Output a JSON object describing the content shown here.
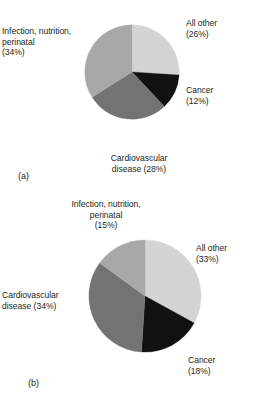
{
  "figure": {
    "background": "#ffffff",
    "text_color": "#231f20"
  },
  "palette": {
    "all_other": "#d4d4d4",
    "cancer": "#111111",
    "cardiovascular": "#737373",
    "infection": "#a8a8a8",
    "outline": "#8c8c8c"
  },
  "panels": [
    {
      "tag": "(a)",
      "slices": [
        {
          "label": "All other",
          "pct_label": "(26%)",
          "value": 26,
          "color_key": "all_other"
        },
        {
          "label": "Cancer",
          "pct_label": "(12%)",
          "value": 12,
          "color_key": "cancer"
        },
        {
          "label": "Cardiovascular disease",
          "pct_label": "(28%)",
          "value": 28,
          "color_key": "cardiovascular"
        },
        {
          "label": "Infection, nutrition, perinatal",
          "pct_label": "(34%)",
          "value": 34,
          "color_key": "infection"
        }
      ],
      "label_text": {
        "infection": "Infection, nutrition,\nperinatal\n(34%)",
        "all_other": "All other\n(26%)",
        "cancer": "Cancer\n(12%)",
        "cardiovascular": "Cardiovascular\ndisease (28%)"
      }
    },
    {
      "tag": "(b)",
      "slices": [
        {
          "label": "All other",
          "pct_label": "(33%)",
          "value": 33,
          "color_key": "all_other"
        },
        {
          "label": "Cancer",
          "pct_label": "(18%)",
          "value": 18,
          "color_key": "cancer"
        },
        {
          "label": "Cardiovascular disease",
          "pct_label": "(34%)",
          "value": 34,
          "color_key": "cardiovascular"
        },
        {
          "label": "Infection, nutrition, perinatal",
          "pct_label": "(15%)",
          "value": 15,
          "color_key": "infection"
        }
      ],
      "label_text": {
        "infection": "Infection, nutrition,\nperinatal\n(15%)",
        "all_other": "All other\n(33%)",
        "cancer": "Cancer\n(18%)",
        "cardiovascular": "Cardiovascular\ndisease (34%)"
      }
    }
  ],
  "chart_data": [
    {
      "type": "pie",
      "title": "(a)",
      "categories": [
        "All other",
        "Cancer",
        "Cardiovascular disease",
        "Infection, nutrition, perinatal"
      ],
      "values": [
        26,
        12,
        28,
        34
      ],
      "units": "percent",
      "start_angle_deg": 0,
      "direction": "clockwise",
      "colors": [
        "#d4d4d4",
        "#111111",
        "#737373",
        "#a8a8a8"
      ],
      "legend": "none",
      "labels_inline": true,
      "xlabel": "",
      "ylabel": ""
    },
    {
      "type": "pie",
      "title": "(b)",
      "categories": [
        "All other",
        "Cancer",
        "Cardiovascular disease",
        "Infection, nutrition, perinatal"
      ],
      "values": [
        33,
        18,
        34,
        15
      ],
      "units": "percent",
      "start_angle_deg": 0,
      "direction": "clockwise",
      "colors": [
        "#d4d4d4",
        "#111111",
        "#737373",
        "#a8a8a8"
      ],
      "legend": "none",
      "labels_inline": true,
      "xlabel": "",
      "ylabel": ""
    }
  ]
}
